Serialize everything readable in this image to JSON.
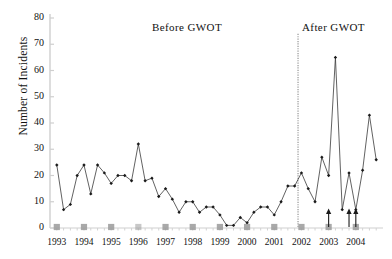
{
  "chart_data": {
    "type": "line",
    "title": "",
    "xlabel": "",
    "ylabel": "Number of Incidents",
    "ylim": [
      0,
      80
    ],
    "yticks": [
      0,
      10,
      20,
      30,
      40,
      50,
      60,
      70,
      80
    ],
    "ytick_labels": [
      "0",
      "10",
      "20",
      "30",
      "40",
      "50",
      "60",
      "70",
      "80"
    ],
    "categories": [
      "1993",
      "1994",
      "1995",
      "1996",
      "1997",
      "1998",
      "1999",
      "2000",
      "2001",
      "2002",
      "2003",
      "2004"
    ],
    "xtick_labels": [
      "1993",
      "1994",
      "1995",
      "1996",
      "1997",
      "1998",
      "1999",
      "2000",
      "2001",
      "2002",
      "2003",
      "2004"
    ],
    "x_interval": "quarterly",
    "grid": false,
    "legend": "none",
    "marker": "diamond",
    "line_color": "#3a3a3a",
    "marker_color": "#1a1a1a",
    "baseline_marker_color": "#9a9a9a",
    "divider_color": "#b0b0b0",
    "series": [
      {
        "name": "Number of Incidents",
        "x": [
          "1993 Q1",
          "1993 Q2",
          "1993 Q3",
          "1993 Q4",
          "1994 Q1",
          "1994 Q2",
          "1994 Q3",
          "1994 Q4",
          "1995 Q1",
          "1995 Q2",
          "1995 Q3",
          "1995 Q4",
          "1996 Q1",
          "1996 Q2",
          "1996 Q3",
          "1996 Q4",
          "1997 Q1",
          "1997 Q2",
          "1997 Q3",
          "1997 Q4",
          "1998 Q1",
          "1998 Q2",
          "1998 Q3",
          "1998 Q4",
          "1999 Q1",
          "1999 Q2",
          "1999 Q3",
          "1999 Q4",
          "2000 Q1",
          "2000 Q2",
          "2000 Q3",
          "2000 Q4",
          "2001 Q1",
          "2001 Q2",
          "2001 Q3",
          "2001 Q4",
          "2002 Q1",
          "2002 Q2",
          "2002 Q3",
          "2002 Q4",
          "2003 Q1",
          "2003 Q2",
          "2003 Q3",
          "2003 Q4",
          "2004 Q1",
          "2004 Q2",
          "2004 Q3",
          "2004 Q4"
        ],
        "values": [
          24,
          7,
          9,
          20,
          24,
          13,
          24,
          21,
          17,
          20,
          20,
          18,
          32,
          18,
          19,
          12,
          15,
          11,
          6,
          10,
          10,
          6,
          8,
          8,
          5,
          1,
          1,
          4,
          2,
          6,
          8,
          8,
          5,
          10,
          16,
          16,
          21,
          15,
          10,
          27,
          20,
          65,
          7,
          21,
          7,
          22,
          43,
          26
        ]
      }
    ],
    "baseline_markers": {
      "description": "gray square markers on the zero baseline at each year tick",
      "y": 0,
      "at": [
        "1993",
        "1994",
        "1995",
        "1996",
        "1997",
        "1998",
        "1999",
        "2000",
        "2001",
        "2002",
        "2003",
        "2004"
      ]
    },
    "annotations": [
      {
        "name": "before-gwot-label",
        "text": "Before  GWOT",
        "x": "1996 Q4",
        "y": 74
      },
      {
        "name": "after-gwot-label",
        "text": "After  GWOT",
        "x": "2003 Q2",
        "y": 74
      },
      {
        "name": "gwot-divider",
        "text": "",
        "x": "2001 Q4",
        "y_top": 74,
        "style": "vertical dotted line"
      },
      {
        "name": "up-arrow-1",
        "text": "",
        "x": "2003 Q1",
        "style": "up arrow from baseline"
      },
      {
        "name": "up-arrow-2",
        "text": "",
        "x": "2003 Q4",
        "style": "up arrow from baseline"
      },
      {
        "name": "up-arrow-3",
        "text": "",
        "x": "2004 Q1",
        "style": "up arrow from baseline"
      }
    ]
  }
}
